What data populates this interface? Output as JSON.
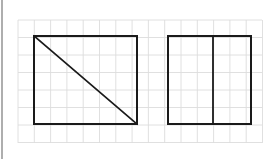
{
  "canvas": {
    "width": 278,
    "height": 159,
    "background_color": "#ffffff",
    "description": "Two geometric figures drawn on a faint square grid"
  },
  "left_border": {
    "name": "left-edge-rule",
    "x": 2,
    "y_start": 0,
    "y_end": 159,
    "color": "#9a9a9a",
    "stroke_width": 1.6
  },
  "grid": {
    "x_start": 18,
    "y_start": 20,
    "x_end": 262,
    "y_end": 143,
    "cell_width": 16.3,
    "cell_height": 17.5,
    "columns": 15,
    "rows": 7,
    "line_color": "#dcdcdc",
    "stroke_width": 0.9,
    "visible": true
  },
  "shapes": [
    {
      "id": "shape-1",
      "name": "square-with-diagonal",
      "type": "rectangle",
      "label": "Square with diagonal",
      "x": 34,
      "y": 36,
      "width": 103,
      "height": 88,
      "stroke_color": "#1a1a1a",
      "stroke_width": 2,
      "fill": "none",
      "internal_lines": [
        {
          "name": "diagonal-line",
          "kind": "diagonal",
          "x1": 34,
          "y1": 36,
          "x2": 137,
          "y2": 124,
          "stroke_color": "#1a1a1a",
          "stroke_width": 1.7
        }
      ],
      "parts": 2
    },
    {
      "id": "shape-2",
      "name": "rectangle-with-vertical-divider",
      "type": "rectangle",
      "label": "Rectangle split vertically",
      "x": 168,
      "y": 36,
      "width": 83,
      "height": 88,
      "stroke_color": "#1a1a1a",
      "stroke_width": 2,
      "fill": "none",
      "internal_lines": [
        {
          "name": "vertical-divider-line",
          "kind": "vertical",
          "x1": 213,
          "y1": 36,
          "x2": 213,
          "y2": 124,
          "stroke_color": "#1a1a1a",
          "stroke_width": 1.8
        }
      ],
      "parts": 2
    }
  ]
}
